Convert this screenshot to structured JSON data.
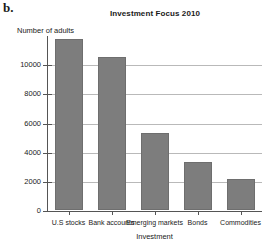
{
  "panel": {
    "label": "b."
  },
  "chart_data": {
    "type": "bar",
    "title": "Investment Focus 2010",
    "xlabel": "Investment",
    "ylabel": "Number of adults",
    "categories": [
      "U.S stocks",
      "Bank accounts",
      "Emerging markets",
      "Bonds",
      "Commodities"
    ],
    "values": [
      11700,
      10500,
      5300,
      3300,
      2100
    ],
    "ylim": [
      0,
      12000
    ],
    "yticks": [
      0,
      2000,
      4000,
      6000,
      8000,
      10000
    ],
    "ytick_labels": [
      "0",
      "2000",
      "4000",
      "6000",
      "8000",
      "10000"
    ],
    "grid": true,
    "legend": "none",
    "bar_color": "#7d7d7d",
    "axis_color": "#555555",
    "gridline_color": "#b9b9b9"
  }
}
